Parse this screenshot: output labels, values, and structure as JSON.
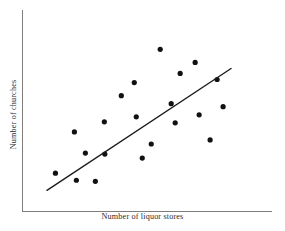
{
  "chart_data": {
    "type": "scatter",
    "title": "",
    "xlabel": "Number of liquor stores",
    "ylabel": "Number of churches",
    "xlim": [
      0,
      100
    ],
    "ylim": [
      0,
      100
    ],
    "grid": false,
    "legend": null,
    "axes": {
      "x_axis_visible": true,
      "y_axis_visible": true,
      "ticks": false,
      "tick_labels": false,
      "axis_color": "#7d7d7d"
    },
    "marker": {
      "shape": "circle",
      "color": "#111111",
      "radius_px": 2.6
    },
    "annotations": [
      {
        "kind": "trend-line",
        "label": "best fit line",
        "color": "#1a1a1a",
        "x0": 9.8,
        "y0": 10.5,
        "x1": 83.6,
        "y1": 71.0
      }
    ],
    "points": [
      {
        "x": 13.2,
        "y": 19.0
      },
      {
        "x": 21.6,
        "y": 15.5
      },
      {
        "x": 20.8,
        "y": 39.5
      },
      {
        "x": 25.2,
        "y": 29.0
      },
      {
        "x": 29.2,
        "y": 15.0
      },
      {
        "x": 32.8,
        "y": 44.5
      },
      {
        "x": 33.0,
        "y": 28.5
      },
      {
        "x": 39.6,
        "y": 57.5
      },
      {
        "x": 44.8,
        "y": 64.0
      },
      {
        "x": 45.6,
        "y": 47.0
      },
      {
        "x": 48.0,
        "y": 26.5
      },
      {
        "x": 51.6,
        "y": 33.5
      },
      {
        "x": 55.2,
        "y": 80.5
      },
      {
        "x": 59.6,
        "y": 53.5
      },
      {
        "x": 61.2,
        "y": 44.0
      },
      {
        "x": 63.2,
        "y": 68.5
      },
      {
        "x": 69.2,
        "y": 74.0
      },
      {
        "x": 70.8,
        "y": 48.0
      },
      {
        "x": 75.2,
        "y": 35.5
      },
      {
        "x": 78.0,
        "y": 65.5
      },
      {
        "x": 80.4,
        "y": 52.0
      }
    ]
  },
  "figure": {
    "background": "#ffffff",
    "width_px": 285,
    "height_px": 231
  }
}
